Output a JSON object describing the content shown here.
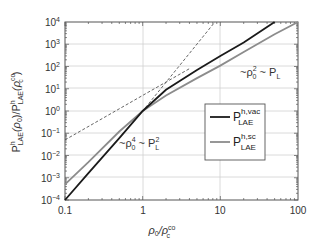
{
  "chart_data": {
    "type": "line",
    "title": "",
    "xlabel": "ρ0/ρc^co",
    "ylabel": "P^h_LAE(ρ0)/P^h_LAE(ρc^co)",
    "xscale": "log",
    "yscale": "log",
    "xlim": [
      0.1,
      100
    ],
    "ylim": [
      0.0001,
      10000
    ],
    "grid": true,
    "x_ticks": [
      "0.1",
      "1",
      "10",
      "100"
    ],
    "y_ticks": [
      "10^-4",
      "10^-3",
      "10^-2",
      "10^-1",
      "10^0",
      "10^1",
      "10^2",
      "10^3",
      "10^4"
    ],
    "legend_position": "center-right",
    "series": [
      {
        "name": "P^h,vac_LAE",
        "color": "#1a1a1a",
        "style": "solid",
        "x": [
          0.1,
          0.2,
          0.5,
          1,
          2,
          5,
          10,
          20,
          50
        ],
        "y": [
          0.0001,
          0.0016,
          0.06,
          1,
          9,
          70,
          300,
          1200,
          10000
        ]
      },
      {
        "name": "P^h,sc_LAE",
        "color": "#8c8c8c",
        "style": "solid",
        "x": [
          0.1,
          0.2,
          0.5,
          1,
          2,
          5,
          10,
          20,
          50,
          100
        ],
        "y": [
          0.0005,
          0.005,
          0.12,
          1,
          5,
          30,
          110,
          450,
          2800,
          10000
        ]
      },
      {
        "name": "~ρ0^4 ~ P_L^2",
        "color": "#555555",
        "style": "dashed",
        "x": [
          0.5,
          1,
          8.5
        ],
        "y": [
          0.0625,
          1,
          10000
        ]
      },
      {
        "name": "~ρ0^2 ~ P_L",
        "color": "#555555",
        "style": "dashed",
        "x": [
          0.1,
          1,
          4
        ],
        "y": [
          0.05,
          5,
          80
        ]
      }
    ],
    "annotations": [
      {
        "text": "~ρ0^2 ~ P_L",
        "x": 30,
        "y": 10
      },
      {
        "text": "~ρ0^4 ~ P_L^2",
        "x": 0.5,
        "y": 0.02
      }
    ]
  },
  "labels": {
    "x_ticks": [
      "0.1",
      "1",
      "10",
      "100"
    ],
    "y_tick_base": "10",
    "y_tick_exps": [
      "4",
      "3",
      "2",
      "1",
      "0",
      "-1",
      "-2",
      "-3",
      "-4"
    ],
    "xlabel_main": "ρ",
    "xlabel_sub": "0",
    "xlabel_slash": "/ρ",
    "xlabel_sup": "co",
    "xlabel_sub2": "c",
    "ylabel_text": "P",
    "annot_top_prefix": "~ρ",
    "annot_top_sup": "2",
    "annot_top_sub": "0",
    "annot_top_suffix": " ~ P",
    "annot_top_sub2": "L",
    "annot_bot_prefix": "~ρ",
    "annot_bot_sup": "4",
    "annot_bot_sub": "0",
    "annot_bot_suffix": " ~ P",
    "annot_bot_sup2": "2",
    "annot_bot_sub2": "L",
    "legend_p": "P",
    "legend_vac_sup": "h,vac",
    "legend_sc_sup": "h,sc",
    "legend_sub": "LAE"
  }
}
